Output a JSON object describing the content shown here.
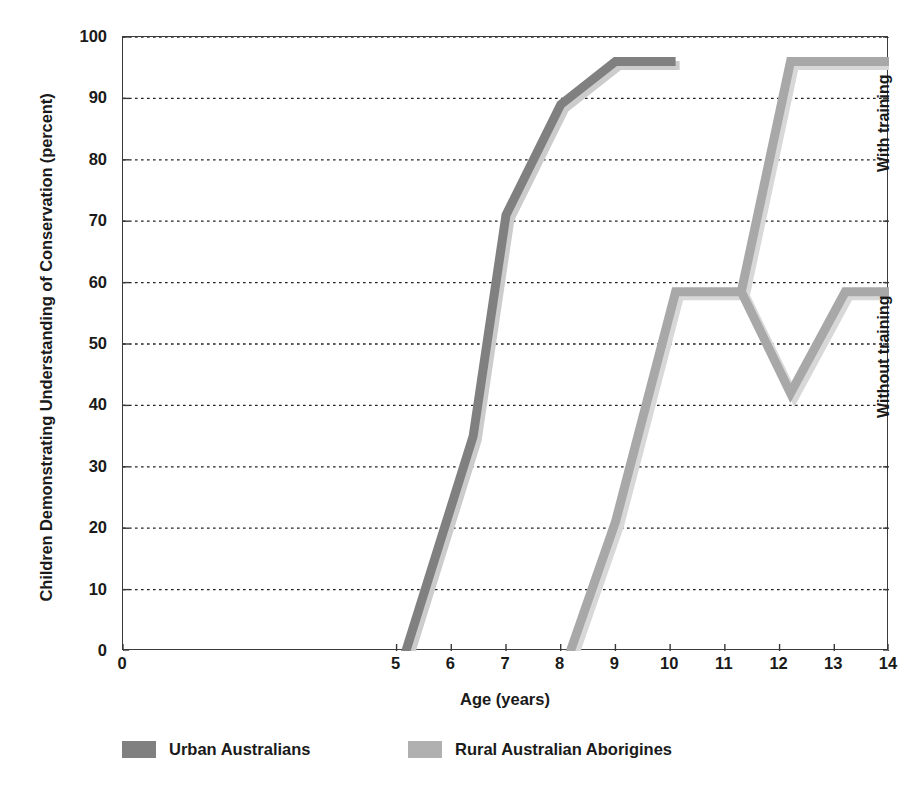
{
  "chart_data": {
    "type": "line",
    "title": "",
    "xlabel": "Age (years)",
    "ylabel": "Children Demonstrating Understanding of Conservation (percent)",
    "xlim": [
      0,
      14
    ],
    "ylim": [
      0,
      100
    ],
    "xticks": [
      0,
      5,
      6,
      7,
      8,
      9,
      10,
      11,
      12,
      13,
      14
    ],
    "yticks": [
      0,
      10,
      20,
      30,
      40,
      50,
      60,
      70,
      80,
      90,
      100
    ],
    "grid": "horizontal-dotted",
    "legend_position": "bottom",
    "series": [
      {
        "name": "Urban Australians",
        "color": "#808080",
        "shadow_color": "#cccccc",
        "points": [
          {
            "x": 5.1,
            "y": -2
          },
          {
            "x": 6.4,
            "y": 35
          },
          {
            "x": 7.0,
            "y": 71
          },
          {
            "x": 8.0,
            "y": 89
          },
          {
            "x": 9.0,
            "y": 96
          },
          {
            "x": 10.1,
            "y": 96
          }
        ]
      },
      {
        "name": "Rural Australian Aborigines",
        "color": "#a8a8a8",
        "shadow_color": "#d8d8d8",
        "points": [
          {
            "x": 8.1,
            "y": -2
          },
          {
            "x": 9.0,
            "y": 21
          },
          {
            "x": 10.1,
            "y": 58.5
          },
          {
            "x": 11.3,
            "y": 58.5
          }
        ],
        "branches": [
          {
            "label": "With training",
            "points": [
              {
                "x": 11.3,
                "y": 58.5
              },
              {
                "x": 12.2,
                "y": 96
              },
              {
                "x": 14.0,
                "y": 96
              }
            ]
          },
          {
            "label": "Without training",
            "points": [
              {
                "x": 11.3,
                "y": 58.5
              },
              {
                "x": 12.2,
                "y": 42
              },
              {
                "x": 13.2,
                "y": 58.5
              },
              {
                "x": 14.0,
                "y": 58.5
              }
            ]
          }
        ]
      }
    ],
    "annotations": [
      {
        "text": "With training",
        "x": 13.75,
        "y": 78,
        "rotation": -90
      },
      {
        "text": "Without training",
        "x": 13.75,
        "y": 38,
        "rotation": -90
      }
    ]
  },
  "legend": {
    "items": [
      {
        "label": "Urban Australians",
        "color": "#808080"
      },
      {
        "label": "Rural Australian Aborigines",
        "color": "#b0b0b0"
      }
    ]
  },
  "axes": {
    "y_title": "Children Demonstrating Understanding of Conservation (percent)",
    "x_title": "Age (years)",
    "y_tick_labels": [
      "100",
      "90",
      "80",
      "70",
      "60",
      "50",
      "40",
      "30",
      "20",
      "10",
      "0"
    ],
    "x_tick_labels": [
      "0",
      "5",
      "6",
      "7",
      "8",
      "9",
      "10",
      "11",
      "12",
      "13",
      "14"
    ]
  }
}
